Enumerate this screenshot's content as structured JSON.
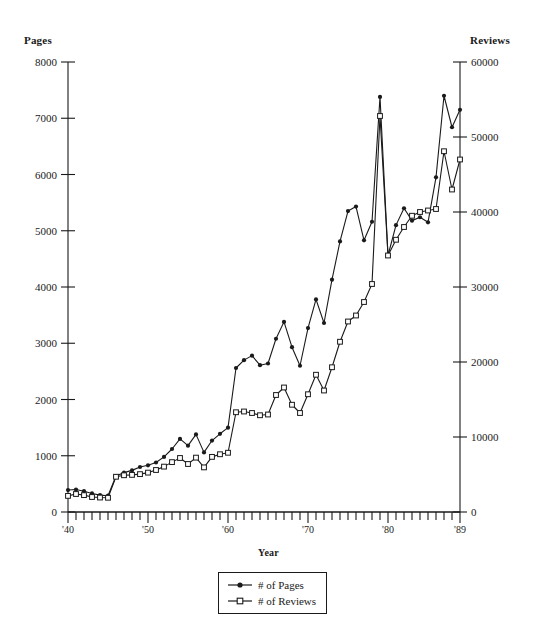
{
  "chart_data": {
    "type": "line",
    "title": "",
    "xlabel": "Year",
    "ylabel": "Pages",
    "y2label": "Reviews",
    "grid": false,
    "legend_position": "bottom-center",
    "xlim": [
      1940,
      1989
    ],
    "ylim": [
      0,
      8000
    ],
    "y2lim": [
      0,
      60000
    ],
    "x_tick_labels": [
      "'40",
      "'50",
      "'60",
      "'70",
      "'80",
      "'89"
    ],
    "x_tick_label_years": [
      1940,
      1950,
      1960,
      1970,
      1980,
      1989
    ],
    "y_tick_labels": [
      "0",
      "1000",
      "2000",
      "3000",
      "4000",
      "5000",
      "6000",
      "7000",
      "8000"
    ],
    "y_tick_values": [
      0,
      1000,
      2000,
      3000,
      4000,
      5000,
      6000,
      7000,
      8000
    ],
    "y2_tick_labels": [
      "0",
      "10000",
      "20000",
      "30000",
      "40000",
      "50000",
      "60000"
    ],
    "y2_tick_values": [
      0,
      10000,
      20000,
      30000,
      40000,
      50000,
      60000
    ],
    "x": [
      1940,
      1941,
      1942,
      1943,
      1944,
      1945,
      1946,
      1947,
      1948,
      1949,
      1950,
      1951,
      1952,
      1953,
      1954,
      1955,
      1956,
      1957,
      1958,
      1959,
      1960,
      1961,
      1962,
      1963,
      1964,
      1965,
      1966,
      1967,
      1968,
      1969,
      1970,
      1971,
      1972,
      1973,
      1974,
      1975,
      1976,
      1977,
      1978,
      1979,
      1980,
      1981,
      1982,
      1983,
      1984,
      1985,
      1986,
      1987,
      1988,
      1989
    ],
    "series": [
      {
        "name": "# of Pages",
        "axis": "left",
        "marker": "filled-circle",
        "values": [
          390,
          400,
          370,
          330,
          300,
          290,
          640,
          700,
          740,
          800,
          830,
          880,
          980,
          1120,
          1300,
          1180,
          1380,
          1060,
          1270,
          1390,
          1500,
          2560,
          2700,
          2780,
          2610,
          2640,
          3080,
          3380,
          2930,
          2600,
          3270,
          3780,
          3360,
          4130,
          4810,
          5350,
          5430,
          4830,
          5160,
          7380,
          4560,
          5100,
          5400,
          5180,
          5240,
          5150,
          5950,
          7400,
          6840,
          7150
        ]
      },
      {
        "name": "# of Reviews",
        "axis": "right",
        "marker": "open-square",
        "values": [
          2150,
          2400,
          2250,
          2000,
          1930,
          1900,
          4700,
          4900,
          4950,
          5050,
          5250,
          5600,
          6050,
          6650,
          7200,
          6400,
          7250,
          5950,
          7350,
          7700,
          7900,
          13300,
          13400,
          13200,
          12900,
          13000,
          15600,
          16600,
          14300,
          13200,
          15700,
          18300,
          16200,
          19300,
          22700,
          25400,
          26200,
          28000,
          30400,
          52800,
          34200,
          36300,
          38000,
          39500,
          40000,
          40200,
          40400,
          48100,
          43000,
          47000
        ]
      }
    ]
  },
  "legend": {
    "items": [
      {
        "label": "# of Pages"
      },
      {
        "label": "# of Reviews"
      }
    ]
  },
  "colors": {
    "ink": "#1a1a1a",
    "background": "#ffffff"
  }
}
